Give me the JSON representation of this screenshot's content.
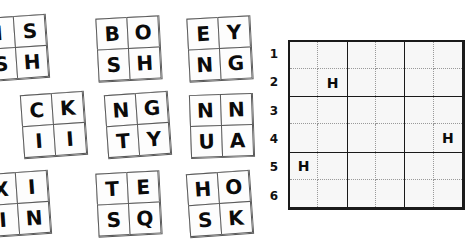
{
  "puzzle": {
    "title": "Letter tile placement puzzle",
    "tray": {
      "name": "tile-tray",
      "tiles": [
        {
          "id": "tile-1",
          "letters": [
            "I",
            "S",
            "S",
            "H"
          ],
          "x": -16,
          "y": 16,
          "rotation": -4,
          "clipped": true
        },
        {
          "id": "tile-2",
          "letters": [
            "B",
            "O",
            "S",
            "H"
          ],
          "x": 97,
          "y": 17,
          "rotation": -3,
          "clipped": false
        },
        {
          "id": "tile-3",
          "letters": [
            "E",
            "Y",
            "N",
            "G"
          ],
          "x": 188,
          "y": 17,
          "rotation": -3,
          "clipped": false
        },
        {
          "id": "tile-4",
          "letters": [
            "C",
            "K",
            "I",
            "I"
          ],
          "x": 22,
          "y": 93,
          "rotation": -4,
          "clipped": false
        },
        {
          "id": "tile-5",
          "letters": [
            "N",
            "G",
            "T",
            "Y"
          ],
          "x": 106,
          "y": 93,
          "rotation": -4,
          "clipped": false
        },
        {
          "id": "tile-6",
          "letters": [
            "N",
            "N",
            "U",
            "A"
          ],
          "x": 190,
          "y": 94,
          "rotation": -2,
          "clipped": false
        },
        {
          "id": "tile-7",
          "letters": [
            "X",
            "I",
            "I",
            "N"
          ],
          "x": -14,
          "y": 172,
          "rotation": -4,
          "clipped": true
        },
        {
          "id": "tile-8",
          "letters": [
            "T",
            "E",
            "S",
            "Q"
          ],
          "x": 97,
          "y": 172,
          "rotation": -3,
          "clipped": false
        },
        {
          "id": "tile-9",
          "letters": [
            "H",
            "O",
            "S",
            "K"
          ],
          "x": 188,
          "y": 172,
          "rotation": -4,
          "clipped": false
        }
      ]
    },
    "board": {
      "name": "answer-grid",
      "rows": 6,
      "columns": 6,
      "block_rows": 3,
      "block_columns": 3,
      "row_labels": [
        "1",
        "2",
        "3",
        "4",
        "5",
        "6"
      ],
      "cells": [
        [
          "",
          "",
          "",
          "",
          "",
          ""
        ],
        [
          "",
          "H",
          "",
          "",
          "",
          ""
        ],
        [
          "",
          "",
          "",
          "",
          "",
          ""
        ],
        [
          "",
          "",
          "",
          "",
          "",
          "H"
        ],
        [
          "H",
          "",
          "",
          "",
          "",
          ""
        ],
        [
          "",
          "",
          "",
          "",
          "",
          ""
        ]
      ]
    }
  },
  "colors": {
    "tile_border": "#5a5a5a",
    "tile_face": "#fdfdfd",
    "grid_border": "#1a1a1a",
    "grid_inner_dotted": "#9a9a9a",
    "grid_background": "#f7f7f7",
    "letter": "#0b0b0b",
    "page_background": "#ffffff"
  }
}
